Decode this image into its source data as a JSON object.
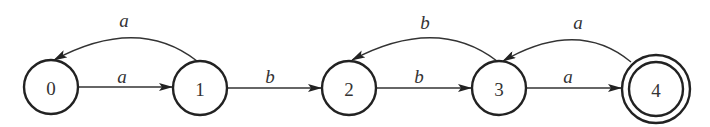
{
  "diagram": {
    "type": "finite-automaton",
    "states": [
      {
        "id": "0",
        "label": "0",
        "cx": 51,
        "cy": 87,
        "r": 27,
        "accepting": false
      },
      {
        "id": "1",
        "label": "1",
        "cx": 200,
        "cy": 88,
        "r": 27,
        "accepting": false
      },
      {
        "id": "2",
        "label": "2",
        "cx": 349,
        "cy": 88,
        "r": 27,
        "accepting": false
      },
      {
        "id": "3",
        "label": "3",
        "cx": 499,
        "cy": 88,
        "r": 27,
        "accepting": false
      },
      {
        "id": "4",
        "label": "4",
        "cx": 656,
        "cy": 89,
        "r": 34,
        "inner_r": 27,
        "accepting": true
      }
    ],
    "transitions": [
      {
        "from": "0",
        "to": "1",
        "symbol": "a",
        "kind": "straight",
        "label_x": 122,
        "label_y": 76
      },
      {
        "from": "1",
        "to": "0",
        "symbol": "a",
        "kind": "arc",
        "label_x": 124,
        "label_y": 20
      },
      {
        "from": "1",
        "to": "2",
        "symbol": "b",
        "kind": "straight",
        "label_x": 270,
        "label_y": 76
      },
      {
        "from": "2",
        "to": "3",
        "symbol": "b",
        "kind": "straight",
        "label_x": 419,
        "label_y": 76
      },
      {
        "from": "3",
        "to": "2",
        "symbol": "b",
        "kind": "arc",
        "label_x": 425,
        "label_y": 22
      },
      {
        "from": "3",
        "to": "4",
        "symbol": "a",
        "kind": "straight",
        "label_x": 568,
        "label_y": 76
      },
      {
        "from": "4",
        "to": "3",
        "symbol": "a",
        "kind": "arc",
        "label_x": 578,
        "label_y": 22
      }
    ],
    "colors": {
      "stroke": "#222222",
      "text": "#333333",
      "background": "#ffffff"
    }
  }
}
